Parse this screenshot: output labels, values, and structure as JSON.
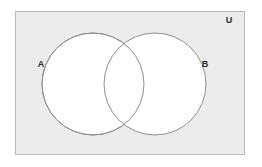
{
  "figure": {
    "type": "venn-diagram",
    "canvas": {
      "width": 262,
      "height": 167,
      "background": "#ffffff"
    },
    "universe": {
      "label": "U",
      "label_name": "universal-set-label",
      "shape": "rectangle",
      "x": 15,
      "y": 11,
      "width": 230,
      "height": 144,
      "fill": "#ececec",
      "stroke": "#b9b9b9",
      "stroke_width": 1,
      "label_x": 229,
      "label_y": 23
    },
    "sets": [
      {
        "label": "A",
        "label_name": "set-a-label",
        "shape": "circle",
        "cx": 93,
        "cy": 84,
        "r": 51,
        "fill": "#ffffff",
        "stroke": "#8f8f8f",
        "stroke_width": 1,
        "label_x": 41,
        "label_y": 67
      },
      {
        "label": "B",
        "label_name": "set-b-label",
        "shape": "circle",
        "cx": 155,
        "cy": 84,
        "r": 51,
        "fill": "#ffffff",
        "stroke": "#8f8f8f",
        "stroke_width": 1,
        "label_x": 203,
        "label_y": 67
      }
    ],
    "intersection": {
      "name": "a-intersect-b-region",
      "top_point": {
        "x": 124,
        "y": 38
      },
      "bottom_point": {
        "x": 124,
        "y": 133
      },
      "fill": "#ffffff"
    },
    "colors": {
      "universe_fill": "#ececec",
      "universe_stroke": "#b9b9b9",
      "circle_fill": "#ffffff",
      "circle_stroke": "#8f8f8f",
      "label_text": "#2b2b2b",
      "page_background": "#ffffff"
    }
  }
}
